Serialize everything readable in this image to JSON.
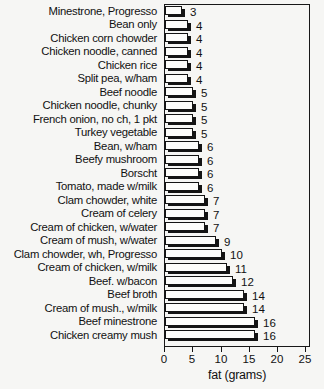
{
  "chart_data": {
    "type": "bar",
    "orientation": "horizontal",
    "title": "",
    "xlabel": "fat (grams)",
    "xlim": [
      0,
      25
    ],
    "xticks": [
      0,
      5,
      10,
      15,
      20,
      25
    ],
    "grid": false,
    "legend": "none",
    "value_labels_shown": true,
    "categories": [
      "Minestrone, Progresso",
      "Bean only",
      "Chicken corn chowder",
      "Chicken noodle, canned",
      "Chicken rice",
      "Split pea, w/ham",
      "Beef noodle",
      "Chicken noodle, chunky",
      "French onion, no ch, 1 pkt",
      "Turkey vegetable",
      "Bean, w/ham",
      "Beefy mushroom",
      "Borscht",
      "Tomato, made w/milk",
      "Clam chowder, white",
      "Cream of celery",
      "Cream of chicken, w/water",
      "Cream of mush, w/water",
      "Clam chowder, wh, Progresso",
      "Cream of chicken, w/milk",
      "Beef. w/bacon",
      "Beef broth",
      "Cream of mush., w/milk",
      "Beef minestrone",
      "Chicken creamy mush"
    ],
    "values": [
      3,
      4,
      4,
      4,
      4,
      4,
      5,
      5,
      5,
      5,
      6,
      6,
      6,
      6,
      7,
      7,
      7,
      9,
      10,
      11,
      12,
      14,
      14,
      16,
      16
    ],
    "colors": {
      "bar_face": "#fdfdfb",
      "bar_shadow": "#141414",
      "frame": "#181818",
      "text": "#111111",
      "background": "#f6f6f4"
    }
  }
}
